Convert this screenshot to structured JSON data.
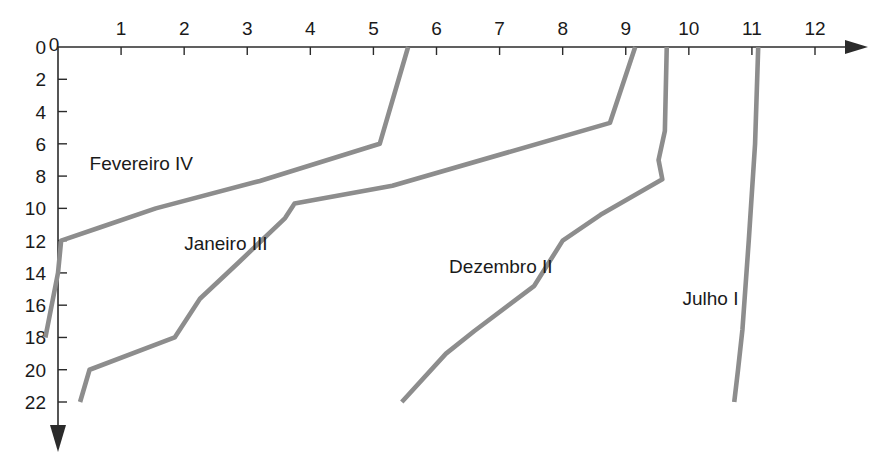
{
  "chart_data": {
    "type": "line",
    "title": "",
    "subtitle": "",
    "xlabel": "",
    "ylabel": "",
    "xlim": [
      0,
      12
    ],
    "ylim": [
      0,
      22
    ],
    "x_axis_position": "top",
    "y_axis_direction": "down",
    "grid": false,
    "legend": "inline-annotations",
    "line_color": "#8d8d8d",
    "axis_color": "#2b2b2b",
    "background_color": "#ffffff",
    "xticks": [
      0,
      1,
      2,
      3,
      4,
      5,
      6,
      7,
      8,
      9,
      10,
      11,
      12
    ],
    "xtick_labels": [
      "0",
      "1",
      "2",
      "3",
      "4",
      "5",
      "6",
      "7",
      "8",
      "9",
      "10",
      "11",
      "12"
    ],
    "yticks": [
      0,
      2,
      4,
      6,
      8,
      10,
      12,
      14,
      16,
      18,
      20,
      22
    ],
    "ytick_labels": [
      "0",
      "2",
      "4",
      "6",
      "8",
      "10",
      "12",
      "14",
      "16",
      "18",
      "20",
      "22"
    ],
    "x_minor_ticks_shown": true,
    "series": [
      {
        "name": "Julho",
        "roman": "I",
        "label": "Julho  I",
        "label_x": 9.9,
        "label_y": 16.0,
        "points": [
          {
            "x": 11.1,
            "y": 0.0
          },
          {
            "x": 11.05,
            "y": 6.0
          },
          {
            "x": 10.95,
            "y": 12.0
          },
          {
            "x": 10.85,
            "y": 17.5
          },
          {
            "x": 10.78,
            "y": 20.0
          },
          {
            "x": 10.72,
            "y": 22.0
          }
        ]
      },
      {
        "name": "Dezembro",
        "roman": "II",
        "label": "Dezembro  II",
        "label_x": 6.2,
        "label_y": 14.0,
        "points": [
          {
            "x": 9.65,
            "y": 0.0
          },
          {
            "x": 9.62,
            "y": 5.2
          },
          {
            "x": 9.52,
            "y": 7.0
          },
          {
            "x": 9.58,
            "y": 8.2
          },
          {
            "x": 8.6,
            "y": 10.4
          },
          {
            "x": 8.0,
            "y": 12.0
          },
          {
            "x": 7.55,
            "y": 14.8
          },
          {
            "x": 6.6,
            "y": 17.6
          },
          {
            "x": 6.15,
            "y": 19.0
          },
          {
            "x": 5.45,
            "y": 22.0
          }
        ]
      },
      {
        "name": "Janeiro",
        "roman": "III",
        "label": "Janeiro  III",
        "label_x": 2.0,
        "label_y": 12.6,
        "points": [
          {
            "x": 9.15,
            "y": 0.0
          },
          {
            "x": 8.75,
            "y": 4.7
          },
          {
            "x": 5.3,
            "y": 8.6
          },
          {
            "x": 3.75,
            "y": 9.7
          },
          {
            "x": 3.6,
            "y": 10.6
          },
          {
            "x": 2.85,
            "y": 13.4
          },
          {
            "x": 2.25,
            "y": 15.6
          },
          {
            "x": 1.85,
            "y": 18.0
          },
          {
            "x": 0.5,
            "y": 20.0
          },
          {
            "x": 0.35,
            "y": 22.0
          }
        ]
      },
      {
        "name": "Fevereiro",
        "roman": "IV",
        "label": "Fevereiro  IV",
        "label_x": 0.5,
        "label_y": 7.6,
        "points": [
          {
            "x": 5.55,
            "y": 0.0
          },
          {
            "x": 5.1,
            "y": 6.0
          },
          {
            "x": 3.2,
            "y": 8.3
          },
          {
            "x": 1.55,
            "y": 10.0
          },
          {
            "x": 0.65,
            "y": 11.2
          },
          {
            "x": 0.05,
            "y": 12.0
          },
          {
            "x": 0.0,
            "y": 14.0
          },
          {
            "x": -0.2,
            "y": 18.0
          }
        ]
      }
    ]
  }
}
